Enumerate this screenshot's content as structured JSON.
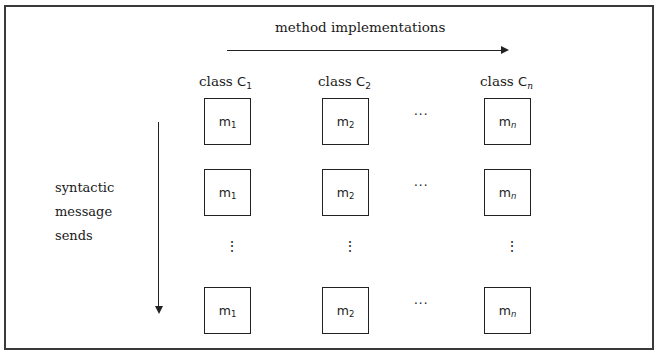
{
  "diagram": {
    "title": "method implementations",
    "side_label_lines": [
      "syntactic",
      "message",
      "sends"
    ],
    "columns": [
      {
        "label_prefix": "class ",
        "label_class": "C",
        "label_sub": "1"
      },
      {
        "label_prefix": "class ",
        "label_class": "C",
        "label_sub": "2"
      },
      {
        "label_prefix": "class ",
        "label_class": "C",
        "label_sub": "n"
      }
    ],
    "rows": [
      {
        "cells": [
          {
            "m": "m",
            "sub": "1"
          },
          {
            "m": "m",
            "sub": "2"
          },
          {
            "m": "m",
            "sub": "n"
          }
        ],
        "ellipsis": "···"
      },
      {
        "cells": [
          {
            "m": "m",
            "sub": "1"
          },
          {
            "m": "m",
            "sub": "2"
          },
          {
            "m": "m",
            "sub": "n"
          }
        ],
        "ellipsis": "···"
      },
      {
        "cells": [
          {
            "m": "m",
            "sub": "1"
          },
          {
            "m": "m",
            "sub": "2"
          },
          {
            "m": "m",
            "sub": "n"
          }
        ],
        "ellipsis": "···"
      }
    ],
    "vertical_ellipsis": "⋮"
  }
}
